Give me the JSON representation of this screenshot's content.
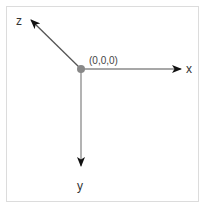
{
  "diagram": {
    "type": "coordinate-axes",
    "origin": {
      "label": "(0,0,0)",
      "x": 81,
      "y": 69
    },
    "axes": [
      {
        "name": "x",
        "label": "x",
        "direction": "right",
        "end": {
          "x": 181,
          "y": 69
        }
      },
      {
        "name": "y",
        "label": "y",
        "direction": "down",
        "end": {
          "x": 81,
          "y": 166
        }
      },
      {
        "name": "z",
        "label": "z",
        "direction": "up-left",
        "end": {
          "x": 31,
          "y": 20
        }
      }
    ],
    "colors": {
      "axis_line": "#8a8a8a",
      "arrowhead": "#111111",
      "origin_dot": "#888888",
      "frame_border": "#dcdcdc",
      "text": "#333333"
    }
  }
}
